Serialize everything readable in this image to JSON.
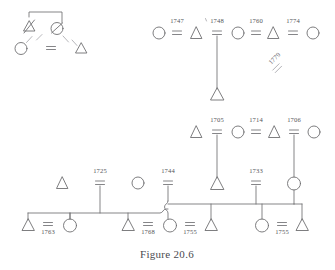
{
  "figure": {
    "caption": "Figure 20.6",
    "kind": "kinship-pedigree-chart",
    "ink_color": "#6f6f72",
    "faint_ink_color": "#a9a9ae",
    "background_color": "#ffffff"
  },
  "symbols": {
    "male": "triangle",
    "female": "circle",
    "marriage": "equals-sign",
    "deceased": "slash-through-symbol",
    "descent": "vertical-line",
    "sibship": "horizontal-bar",
    "line_hop": "s-curve-bridge"
  },
  "generations": [
    {
      "name": "top-left-fragment",
      "row": 1,
      "nodes": [
        {
          "id": "tl-male-deceased",
          "sex": "male",
          "deceased": true,
          "cx": 29,
          "cy": 28
        },
        {
          "id": "tl-female-deceased",
          "sex": "female",
          "deceased": true,
          "cx": 57,
          "cy": 28
        },
        {
          "id": "tl-female-child",
          "sex": "female",
          "deceased": false,
          "cx": 21,
          "cy": 48
        },
        {
          "id": "tl-male-child",
          "sex": "male",
          "deceased": false,
          "cx": 81,
          "cy": 48
        }
      ],
      "unions": [
        {
          "id": "tl-union",
          "date": "",
          "cx": 51,
          "cy": 48
        }
      ]
    },
    {
      "name": "top-right-row",
      "row": 1,
      "nodes": [
        {
          "id": "tr-f1",
          "sex": "female",
          "cx": 159,
          "cy": 33
        },
        {
          "id": "tr-m1",
          "sex": "male",
          "cx": 196,
          "cy": 33
        },
        {
          "id": "tr-f2",
          "sex": "female",
          "cx": 238,
          "cy": 33
        },
        {
          "id": "tr-m2",
          "sex": "male",
          "cx": 273,
          "cy": 33
        },
        {
          "id": "tr-f3",
          "sex": "female",
          "cx": 313,
          "cy": 33
        }
      ],
      "unions": [
        {
          "id": "u-1747",
          "date": "1747",
          "cx": 177,
          "cy": 33
        },
        {
          "id": "u-1748",
          "date": "1748",
          "cx": 217,
          "cy": 33
        },
        {
          "id": "u-1760",
          "date": "1760",
          "cx": 256,
          "cy": 33
        },
        {
          "id": "u-1774",
          "date": "1774",
          "cx": 293,
          "cy": 33
        }
      ],
      "children": [
        {
          "id": "tr-child-male",
          "sex": "male",
          "cx": 217,
          "cy": 95,
          "parent_union": "u-1748"
        }
      ],
      "loose_unions": [
        {
          "id": "u-1779",
          "date": "1779",
          "cx": 277,
          "cy": 66,
          "rotation_deg": -45
        }
      ]
    },
    {
      "name": "middle-row",
      "row": 2,
      "nodes": [
        {
          "id": "m-m1",
          "sex": "male",
          "cx": 196,
          "cy": 132
        },
        {
          "id": "m-f1",
          "sex": "female",
          "cx": 238,
          "cy": 132
        },
        {
          "id": "m-m2",
          "sex": "male",
          "cx": 274,
          "cy": 132
        },
        {
          "id": "m-f2",
          "sex": "female",
          "cx": 314,
          "cy": 132
        }
      ],
      "unions": [
        {
          "id": "u-1705",
          "date": "1705",
          "cx": 217,
          "cy": 132
        },
        {
          "id": "u-1714",
          "date": "1714",
          "cx": 256,
          "cy": 132
        },
        {
          "id": "u-1706",
          "date": "1706",
          "cx": 294,
          "cy": 132
        }
      ],
      "children": [
        {
          "id": "m-child-male",
          "sex": "male",
          "cx": 217,
          "cy": 184,
          "parent_union": "u-1705"
        },
        {
          "id": "m-child-female",
          "sex": "female",
          "cx": 294,
          "cy": 183,
          "parent_union": "u-1706"
        }
      ]
    },
    {
      "name": "third-row",
      "row": 3,
      "nodes": [
        {
          "id": "t-m1",
          "sex": "male",
          "cx": 62,
          "cy": 183
        },
        {
          "id": "t-f1",
          "sex": "female",
          "cx": 138,
          "cy": 183
        },
        {
          "id": "t-m2",
          "sex": "male",
          "cx": 196,
          "cy": 184
        }
      ],
      "unions": [
        {
          "id": "u-1725",
          "date": "1725",
          "cx": 100,
          "cy": 183
        },
        {
          "id": "u-1744",
          "date": "1744",
          "cx": 168,
          "cy": 183
        },
        {
          "id": "u-1733",
          "date": "1733",
          "cx": 256,
          "cy": 183
        }
      ]
    },
    {
      "name": "bottom-row",
      "row": 4,
      "nodes": [
        {
          "id": "b-m1",
          "sex": "male",
          "cx": 28,
          "cy": 226
        },
        {
          "id": "b-f1",
          "sex": "female",
          "cx": 70,
          "cy": 225
        },
        {
          "id": "b-m2",
          "sex": "male",
          "cx": 128,
          "cy": 226
        },
        {
          "id": "b-f2",
          "sex": "female",
          "cx": 170,
          "cy": 225
        },
        {
          "id": "b-m3",
          "sex": "male",
          "cx": 211,
          "cy": 226
        },
        {
          "id": "b-f3",
          "sex": "female",
          "cx": 262,
          "cy": 225
        },
        {
          "id": "b-m4",
          "sex": "male",
          "cx": 302,
          "cy": 226
        }
      ],
      "unions": [
        {
          "id": "u-1763",
          "date": "1763",
          "cx": 48,
          "cy": 224
        },
        {
          "id": "u-1768",
          "date": "1768",
          "cx": 148,
          "cy": 224
        },
        {
          "id": "u-1755a",
          "date": "1755",
          "cx": 190,
          "cy": 224
        },
        {
          "id": "u-1755b",
          "date": "1755",
          "cx": 282,
          "cy": 224
        }
      ]
    }
  ],
  "date_labels": [
    "1747",
    "1748",
    "1760",
    "1774",
    "1779",
    "1705",
    "1714",
    "1706",
    "1725",
    "1744",
    "1733",
    "1763",
    "1768",
    "1755",
    "1755"
  ]
}
